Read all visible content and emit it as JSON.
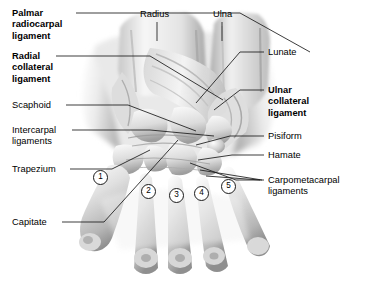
{
  "figure": {
    "kind": "anatomical-illustration",
    "style": "grayscale pencil/airbrush medical illustration"
  },
  "labels_left": [
    {
      "id": "palmar-radiocarpal-ligament",
      "text": "Palmar\nradiocarpal\nligament",
      "bold": true,
      "x": 12,
      "y": 8,
      "lead_from": [
        76,
        13
      ],
      "lead_to": [
        [
          240,
          13
        ],
        [
          310,
          52
        ]
      ]
    },
    {
      "id": "radial-collateral-ligament",
      "text": "Radial\ncollateral\nligament",
      "bold": true,
      "x": 12,
      "y": 51,
      "lead_from": [
        56,
        56
      ],
      "lead_to": [
        [
          150,
          56
        ],
        [
          223,
          100
        ]
      ]
    },
    {
      "id": "scaphoid",
      "text": "Scaphoid",
      "bold": false,
      "x": 12,
      "y": 100,
      "lead_from": [
        66,
        105
      ],
      "lead_to": [
        [
          128,
          105
        ],
        [
          196,
          131
        ]
      ]
    },
    {
      "id": "intercarpal-ligaments",
      "text": "Intercarpal\nligaments",
      "bold": false,
      "x": 12,
      "y": 125,
      "lead_from": [
        72,
        130
      ],
      "lead_to": [
        [
          150,
          130
        ],
        [
          214,
          136
        ]
      ]
    },
    {
      "id": "trapezium",
      "text": "Trapezium",
      "bold": false,
      "x": 12,
      "y": 164,
      "lead_from": [
        70,
        169
      ],
      "lead_to": [
        [
          112,
          169
        ],
        [
          150,
          150
        ]
      ]
    },
    {
      "id": "capitate",
      "text": "Capitate",
      "bold": false,
      "x": 12,
      "y": 217,
      "lead_from": [
        62,
        222
      ],
      "lead_to": [
        [
          104,
          222
        ],
        [
          178,
          140
        ]
      ]
    }
  ],
  "labels_right": [
    {
      "id": "lunate",
      "text": "Lunate",
      "bold": false,
      "x": 268,
      "y": 47,
      "lead_from": [
        264,
        52
      ],
      "lead_to": [
        [
          240,
          52
        ],
        [
          196,
          103
        ]
      ]
    },
    {
      "id": "ulnar-collateral-ligament",
      "text": "Ulnar\ncollateral\nligament",
      "bold": true,
      "x": 268,
      "y": 85,
      "lead_from": [
        264,
        90
      ],
      "lead_to": [
        [
          240,
          90
        ],
        [
          214,
          110
        ]
      ]
    },
    {
      "id": "pisiform",
      "text": "Pisiform",
      "bold": false,
      "x": 268,
      "y": 131,
      "lead_from": [
        264,
        136
      ],
      "lead_to": [
        [
          230,
          136
        ],
        [
          196,
          145
        ]
      ]
    },
    {
      "id": "hamate",
      "text": "Hamate",
      "bold": false,
      "x": 268,
      "y": 150,
      "lead_from": [
        264,
        155
      ],
      "lead_to": [
        [
          232,
          155
        ],
        [
          198,
          160
        ]
      ]
    },
    {
      "id": "carpometacarpal-ligaments",
      "text": "Carpometacarpal\nligaments",
      "bold": false,
      "x": 268,
      "y": 175,
      "lead_from": [
        264,
        180
      ],
      "lead_to": [
        [
          236,
          180
        ],
        [
          190,
          163
        ]
      ]
    }
  ],
  "labels_top": [
    {
      "id": "radius",
      "text": "Radius",
      "bold": false,
      "x": 140,
      "y": 9,
      "lead_x": 157,
      "lead_y1": 22,
      "lead_y2": 41
    },
    {
      "id": "ulna",
      "text": "Ulna",
      "bold": false,
      "x": 213,
      "y": 9,
      "lead_x": 222,
      "lead_y1": 22,
      "lead_y2": 41
    }
  ],
  "metacarpal_markers": [
    {
      "id": "metacarpal-1",
      "number": "1",
      "x": 93,
      "y": 170
    },
    {
      "id": "metacarpal-2",
      "number": "2",
      "x": 141,
      "y": 184
    },
    {
      "id": "metacarpal-3",
      "number": "3",
      "x": 169,
      "y": 188
    },
    {
      "id": "metacarpal-4",
      "number": "4",
      "x": 194,
      "y": 186
    },
    {
      "id": "metacarpal-5",
      "number": "5",
      "x": 221,
      "y": 179
    }
  ],
  "colors": {
    "background": "#ffffff",
    "text": "#000000",
    "leader_line": "#1a1a1a",
    "bone_light": "#f2f2f2",
    "bone_mid": "#cfcfcf",
    "bone_shadow": "#8e8e8e",
    "bone_dark": "#5e5e5e"
  }
}
